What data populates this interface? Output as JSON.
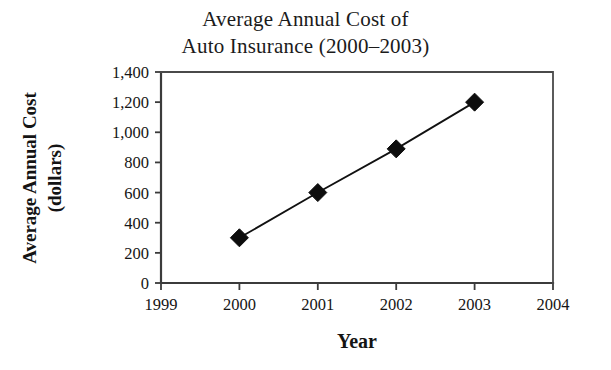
{
  "chart_data": {
    "type": "line",
    "title": "Average Annual Cost of Auto Insurance (2000–2003)",
    "title_lines": [
      "Average Annual Cost of",
      "Auto Insurance (2000–2003)"
    ],
    "xlabel": "Year",
    "ylabel": "Average Annual Cost (dollars)",
    "ylabel_lines": [
      "Average Annual Cost",
      "(dollars)"
    ],
    "x": [
      2000,
      2001,
      2002,
      2003
    ],
    "values": [
      300,
      600,
      890,
      1200
    ],
    "categories": [
      "2000",
      "2001",
      "2002",
      "2003"
    ],
    "xlim": [
      1999,
      2004
    ],
    "ylim": [
      0,
      1400
    ],
    "xticks": [
      1999,
      2000,
      2001,
      2002,
      2003,
      2004
    ],
    "xtick_labels": [
      "1999",
      "2000",
      "2001",
      "2002",
      "2003",
      "2004"
    ],
    "yticks": [
      0,
      200,
      400,
      600,
      800,
      1000,
      1200,
      1400
    ],
    "ytick_labels": [
      "0",
      "200",
      "400",
      "600",
      "800",
      "1,000",
      "1,200",
      "1,400"
    ],
    "grid": false,
    "legend": null,
    "marker": "diamond",
    "marker_color": "#0d0d0d",
    "line_color": "#111111",
    "axis_color": "#3b3b3b",
    "background": "#ffffff",
    "series": [
      {
        "name": "Average Annual Cost",
        "points": [
          {
            "x": "2000",
            "y": 300
          },
          {
            "x": "2001",
            "y": 600
          },
          {
            "x": "2002",
            "y": 890
          },
          {
            "x": "2003",
            "y": 1200
          }
        ]
      }
    ]
  },
  "plot_geometry": {
    "left": 161,
    "right": 553,
    "top": 72,
    "bottom": 283,
    "marker_radius": 9
  }
}
